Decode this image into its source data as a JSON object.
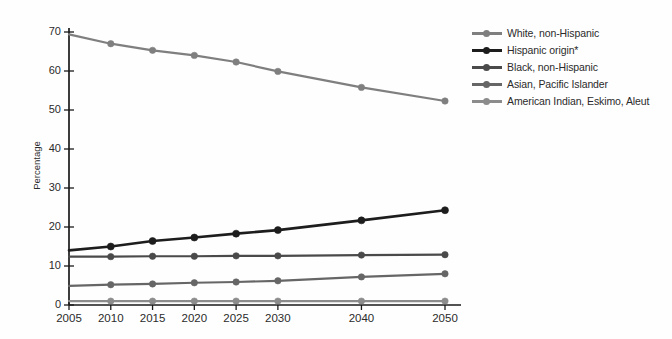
{
  "chart_data": {
    "type": "line",
    "title": "",
    "subtitle": "",
    "xlabel": "",
    "ylabel": "Percentage",
    "x": [
      2005,
      2010,
      2015,
      2020,
      2025,
      2030,
      2040,
      2050
    ],
    "categories": [
      "2005",
      "2010",
      "2015",
      "2020",
      "2025",
      "2030",
      "2040",
      "2050"
    ],
    "xlim": [
      2005,
      2050
    ],
    "ylim": [
      0,
      70
    ],
    "yticks": [
      0,
      10,
      20,
      30,
      40,
      50,
      60,
      70
    ],
    "ytick_labels": [
      "0",
      "10",
      "20",
      "30",
      "40",
      "50",
      "60",
      "70"
    ],
    "xtick_labels": [
      "2005",
      "2010",
      "2015",
      "2020",
      "2025",
      "2030",
      "2040",
      "2050"
    ],
    "grid": false,
    "legend_position": "right",
    "marker": "circle",
    "series": [
      {
        "name": "White, non-Hispanic",
        "color": "#7f7f7f",
        "values": [
          69.4,
          67.0,
          65.3,
          64.0,
          62.3,
          59.9,
          55.8,
          52.3
        ]
      },
      {
        "name": "Hispanic origin*",
        "color": "#1d1d1d",
        "values": [
          14.0,
          15.0,
          16.4,
          17.3,
          18.3,
          19.2,
          21.7,
          24.3
        ]
      },
      {
        "name": "Black, non-Hispanic",
        "color": "#4a4a4a",
        "values": [
          12.4,
          12.4,
          12.5,
          12.5,
          12.6,
          12.6,
          12.8,
          12.9
        ]
      },
      {
        "name": "Asian, Pacific Islander",
        "color": "#666666",
        "values": [
          4.9,
          5.2,
          5.4,
          5.7,
          5.9,
          6.2,
          7.2,
          8.0
        ]
      },
      {
        "name": "American Indian, Eskimo, Aleut",
        "color": "#8c8c8c",
        "values": [
          1.0,
          1.0,
          1.0,
          1.0,
          1.0,
          1.0,
          1.0,
          1.0
        ]
      }
    ]
  },
  "legend": {
    "items": [
      {
        "label": "White, non-Hispanic"
      },
      {
        "label": "Hispanic origin*"
      },
      {
        "label": "Black, non-Hispanic"
      },
      {
        "label": "Asian, Pacific Islander"
      },
      {
        "label": "American Indian, Eskimo, Aleut"
      }
    ]
  },
  "axes": {
    "y_title": "Percentage",
    "axis_color": "#1a1a1a"
  }
}
